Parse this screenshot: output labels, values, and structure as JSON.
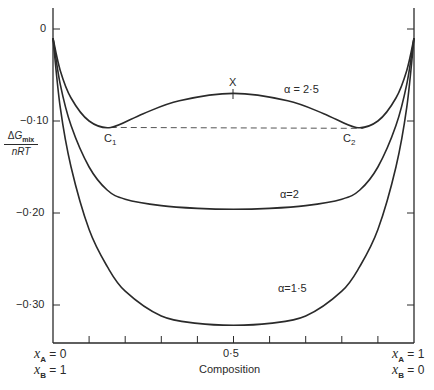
{
  "chart_data": {
    "type": "line",
    "title": "",
    "xlabel": "Composition",
    "ylabel": "ΔG_mix / nRT",
    "xlim": [
      0,
      1
    ],
    "ylim": [
      -0.34,
      0.03
    ],
    "grid": false,
    "x_ticks": [
      0,
      0.1,
      0.2,
      0.3,
      0.4,
      0.5,
      0.6,
      0.7,
      0.8,
      0.9,
      1.0
    ],
    "x_tick_labels": [
      "",
      "",
      "",
      "",
      "",
      "0·5",
      "",
      "",
      "",
      "",
      ""
    ],
    "y_ticks": [
      0,
      -0.1,
      -0.2,
      -0.3
    ],
    "y_tick_labels": [
      "0",
      "−0·10",
      "−0·20",
      "−0·30"
    ],
    "x_end_labels": {
      "left": [
        "x_A = 0",
        "x_B = 1"
      ],
      "right": [
        "x_A = 1",
        "x_B = 0"
      ]
    },
    "series": [
      {
        "name": "α=2·5",
        "x": [
          0.0,
          0.02,
          0.05,
          0.1,
          0.16,
          0.25,
          0.35,
          0.5,
          0.65,
          0.75,
          0.84,
          0.9,
          0.95,
          0.98,
          1.0
        ],
        "y": [
          -0.01,
          -0.045,
          -0.075,
          -0.1,
          -0.107,
          -0.092,
          -0.078,
          -0.07,
          -0.078,
          -0.092,
          -0.107,
          -0.1,
          -0.075,
          -0.045,
          -0.01
        ]
      },
      {
        "name": "α=2",
        "x": [
          0.0,
          0.02,
          0.05,
          0.1,
          0.15,
          0.2,
          0.3,
          0.4,
          0.5,
          0.6,
          0.7,
          0.8,
          0.85,
          0.9,
          0.95,
          0.98,
          1.0
        ],
        "y": [
          -0.01,
          -0.06,
          -0.105,
          -0.15,
          -0.175,
          -0.185,
          -0.192,
          -0.195,
          -0.196,
          -0.195,
          -0.192,
          -0.185,
          -0.175,
          -0.15,
          -0.105,
          -0.06,
          -0.01
        ]
      },
      {
        "name": "α=1·5",
        "x": [
          0.0,
          0.02,
          0.05,
          0.1,
          0.15,
          0.2,
          0.3,
          0.4,
          0.5,
          0.6,
          0.7,
          0.8,
          0.85,
          0.9,
          0.95,
          0.98,
          1.0
        ],
        "y": [
          -0.01,
          -0.085,
          -0.15,
          -0.218,
          -0.258,
          -0.285,
          -0.312,
          -0.32,
          -0.322,
          -0.32,
          -0.312,
          -0.285,
          -0.258,
          -0.218,
          -0.15,
          -0.085,
          -0.01
        ]
      }
    ],
    "annotations": [
      {
        "text": "X",
        "x": 0.5,
        "y": -0.07,
        "note": "local maximum of α=2·5 curve"
      },
      {
        "text": "C1",
        "x": 0.16,
        "y": -0.107,
        "note": "left common-tangent point"
      },
      {
        "text": "C2",
        "x": 0.86,
        "y": -0.108,
        "note": "right common-tangent point"
      },
      {
        "text": "common tangent (dashed)",
        "from": [
          0.16,
          -0.107
        ],
        "to": [
          0.86,
          -0.108
        ]
      }
    ]
  },
  "labels": {
    "y_num_delta": "Δ",
    "y_num_g": "G",
    "y_num_sub": "mix",
    "y_den": "nRT",
    "ytick_0": "0",
    "ytick_1": "−0·10",
    "ytick_2": "−0·20",
    "ytick_3": "−0·30",
    "xtick_mid": "0·5",
    "xlabel": "Composition",
    "curve_25": "α = 2·5",
    "curve_2": "α=2",
    "curve_15": "α=1·5",
    "point_x": "X",
    "point_c1_main": "C",
    "point_c1_sub": "1",
    "point_c2_main": "C",
    "point_c2_sub": "2",
    "left_xa_var": "x",
    "left_xa_sub": "A",
    "left_xa_val": "= 0",
    "left_xb_var": "x",
    "left_xb_sub": "B",
    "left_xb_val": "= 1",
    "right_xa_var": "x",
    "right_xa_sub": "A",
    "right_xa_val": "= 1",
    "right_xb_var": "x",
    "right_xb_sub": "B",
    "right_xb_val": "= 0"
  },
  "colors": {
    "line": "#2a2a2a",
    "background": "#ffffff"
  }
}
